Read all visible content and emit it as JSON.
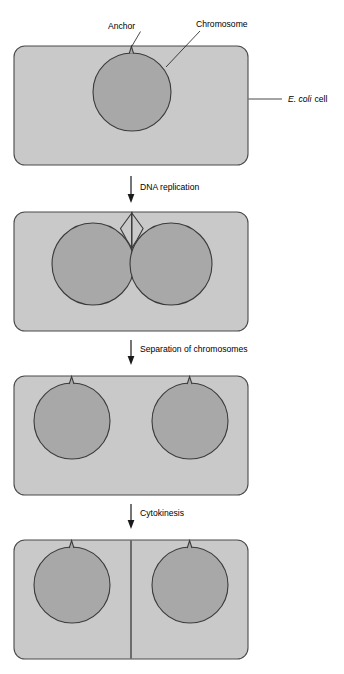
{
  "figure": {
    "organism_label": "E. coli cell",
    "organism_label_italic_part": "E. coli",
    "organism_label_plain_part": "cell"
  },
  "callouts": [
    {
      "id": "anchor",
      "label": "Anchor",
      "icon": "leader-line"
    },
    {
      "id": "chromosome",
      "label": "Chromosome",
      "icon": "leader-line"
    },
    {
      "id": "ecoli-cell",
      "label": "E. coli cell",
      "icon": "leader-line"
    }
  ],
  "steps": [
    {
      "id": "dna-replication",
      "label": "DNA replication",
      "icon": "down-arrow-icon"
    },
    {
      "id": "separation-of-chromosomes",
      "label": "Separation of chromosomes",
      "icon": "down-arrow-icon"
    },
    {
      "id": "cytokinesis",
      "label": "Cytokinesis",
      "icon": "down-arrow-icon"
    }
  ],
  "panels": [
    {
      "id": "panel-1",
      "stage_name": "Single chromosome attached to anchor",
      "chromosome_count": 1,
      "septum": false
    },
    {
      "id": "panel-2",
      "stage_name": "Chromosome replicated, two copies attached",
      "chromosome_count": 2,
      "septum": false
    },
    {
      "id": "panel-3",
      "stage_name": "Chromosomes separated to opposite poles",
      "chromosome_count": 2,
      "septum": false
    },
    {
      "id": "panel-4",
      "stage_name": "Cell divided by septum",
      "chromosome_count": 2,
      "septum": true
    }
  ],
  "colors": {
    "cell_fill": "#c9c9c9",
    "cell_stroke": "#4a4a4a",
    "chromosome_fill": "#a8a8a8",
    "chromosome_stroke": "#3a3a3a",
    "leader_line": "#1a1a1a",
    "arrow": "#1a1a1a",
    "background": "#ffffff"
  }
}
